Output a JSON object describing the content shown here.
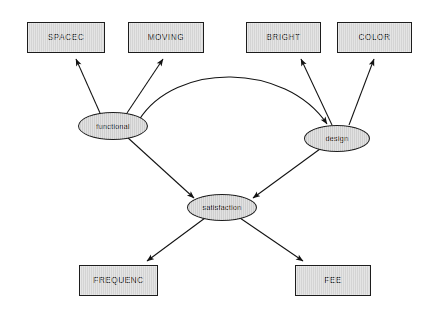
{
  "diagram": {
    "type": "path-diagram",
    "background_color": "#ffffff",
    "rect_fill": "#d4d4d4",
    "ellipse_fill": "#cfcfcf",
    "stroke_color": "#1d1d1d",
    "observed_variables": [
      {
        "id": "spacec",
        "label": "SPACEC",
        "x": 27,
        "y": 22,
        "w": 78,
        "h": 31
      },
      {
        "id": "moving",
        "label": "MOVING",
        "x": 128,
        "y": 22,
        "w": 76,
        "h": 31
      },
      {
        "id": "bright",
        "label": "BRIGHT",
        "x": 246,
        "y": 22,
        "w": 75,
        "h": 31
      },
      {
        "id": "color",
        "label": "COLOR",
        "x": 337,
        "y": 22,
        "w": 75,
        "h": 31
      },
      {
        "id": "frequenc",
        "label": "FREQUENC",
        "x": 79,
        "y": 265,
        "w": 79,
        "h": 31
      },
      {
        "id": "fee",
        "label": "FEE",
        "x": 295,
        "y": 265,
        "w": 76,
        "h": 31
      }
    ],
    "latent_variables": [
      {
        "id": "functional",
        "label": "functional",
        "cx": 113,
        "cy": 126,
        "rx": 35,
        "ry": 14
      },
      {
        "id": "design",
        "label": "design",
        "cx": 337,
        "cy": 138,
        "rx": 33,
        "ry": 13.5
      },
      {
        "id": "satisfaction",
        "label": "satisfaction",
        "cx": 222,
        "cy": 207,
        "rx": 35,
        "ry": 13.5
      }
    ],
    "edges": [
      {
        "id": "functional-to-spacec",
        "from": "functional",
        "to": "spacec",
        "arrow": "single"
      },
      {
        "id": "functional-to-moving",
        "from": "functional",
        "to": "moving",
        "arrow": "single"
      },
      {
        "id": "design-to-bright",
        "from": "design",
        "to": "bright",
        "arrow": "single"
      },
      {
        "id": "design-to-color",
        "from": "design",
        "to": "color",
        "arrow": "single"
      },
      {
        "id": "functional-design-covariance",
        "from": "functional",
        "to": "design",
        "arrow": "double",
        "shape": "curved-arc"
      },
      {
        "id": "functional-to-satisfaction",
        "from": "functional",
        "to": "satisfaction",
        "arrow": "single"
      },
      {
        "id": "design-to-satisfaction",
        "from": "design",
        "to": "satisfaction",
        "arrow": "single"
      },
      {
        "id": "satisfaction-to-frequenc",
        "from": "satisfaction",
        "to": "frequenc",
        "arrow": "single"
      },
      {
        "id": "satisfaction-to-fee",
        "from": "satisfaction",
        "to": "fee",
        "arrow": "single"
      }
    ]
  }
}
